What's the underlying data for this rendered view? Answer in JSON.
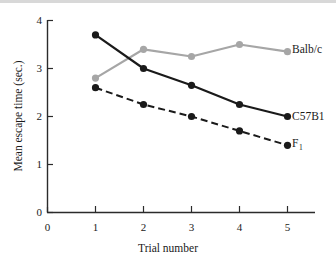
{
  "chart_data": {
    "type": "line",
    "title": "",
    "xlabel": "Trial number",
    "ylabel": "Mean escape time (sec.)",
    "x": [
      1,
      2,
      3,
      4,
      5
    ],
    "xticklabels": [
      "0",
      "1",
      "2",
      "3",
      "4",
      "5"
    ],
    "xticks": [
      0,
      1,
      2,
      3,
      4,
      5
    ],
    "yticklabels": [
      "0",
      "1",
      "2",
      "3",
      "4"
    ],
    "yticks": [
      0,
      1,
      2,
      3,
      4
    ],
    "xlim": [
      0,
      5.6
    ],
    "ylim": [
      0,
      4
    ],
    "grid": false,
    "legend_position": "right-of-line-ends",
    "series": [
      {
        "name": "Balb/c",
        "values": [
          2.8,
          3.4,
          3.25,
          3.5,
          3.35
        ],
        "color": "#a6a6a6",
        "style": "solid",
        "marker": "circle"
      },
      {
        "name": "C57B1",
        "values": [
          3.7,
          3.0,
          2.65,
          2.25,
          2.0
        ],
        "color": "#1a1a1a",
        "style": "solid",
        "marker": "circle"
      },
      {
        "name": "F1",
        "label_base": "F",
        "label_subscript": "1",
        "values": [
          2.6,
          2.25,
          2.0,
          1.7,
          1.4
        ],
        "color": "#1a1a1a",
        "style": "dashed",
        "marker": "circle"
      }
    ]
  },
  "colors": {
    "axis": "#2b2b2b",
    "dark_series": "#1a1a1a",
    "gray_series": "#a6a6a6",
    "background": "#ffffff",
    "top_rule": "#d8d8d8"
  }
}
